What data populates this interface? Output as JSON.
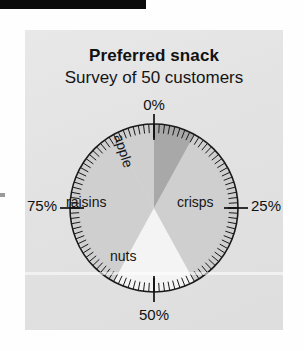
{
  "page": {
    "background_color": "#fefefe",
    "panel_color": "#e3e3e3",
    "top_bar_color": "#0b0b0b"
  },
  "figure": {
    "title": "Preferred snack",
    "subtitle": "Survey of 50 customers"
  },
  "chart_data": {
    "type": "pie",
    "title": "Preferred snack",
    "subtitle": "Survey of 50 customers",
    "xlabel": "",
    "ylabel": "",
    "categories": [
      "apple",
      "crisps",
      "nuts",
      "raisins"
    ],
    "values": [
      8,
      34,
      16,
      42
    ],
    "units": "percent",
    "start_angle_deg": 0,
    "direction": "clockwise",
    "scale_labels": [
      "0%",
      "25%",
      "50%",
      "75%"
    ],
    "scale_positions_deg": [
      0,
      90,
      180,
      270
    ],
    "legend": "none",
    "grid": false,
    "slice_colors": [
      "#a8a8a8",
      "#cfcfcf",
      "#f4f4f4",
      "#cfcfcf"
    ],
    "outline_color": "#1a1a1a",
    "tick_count": 100,
    "major_tick_every": 25,
    "annotations": [
      "Percentage scale ring with 100 minor ticks, major ticks at 0%, 25%, 50%, 75%"
    ]
  },
  "scale": {
    "top": "0%",
    "right": "25%",
    "bottom": "50%",
    "left": "75%"
  },
  "slices": {
    "apple": "apple",
    "crisps": "crisps",
    "nuts": "nuts",
    "raisins": "raisins"
  }
}
